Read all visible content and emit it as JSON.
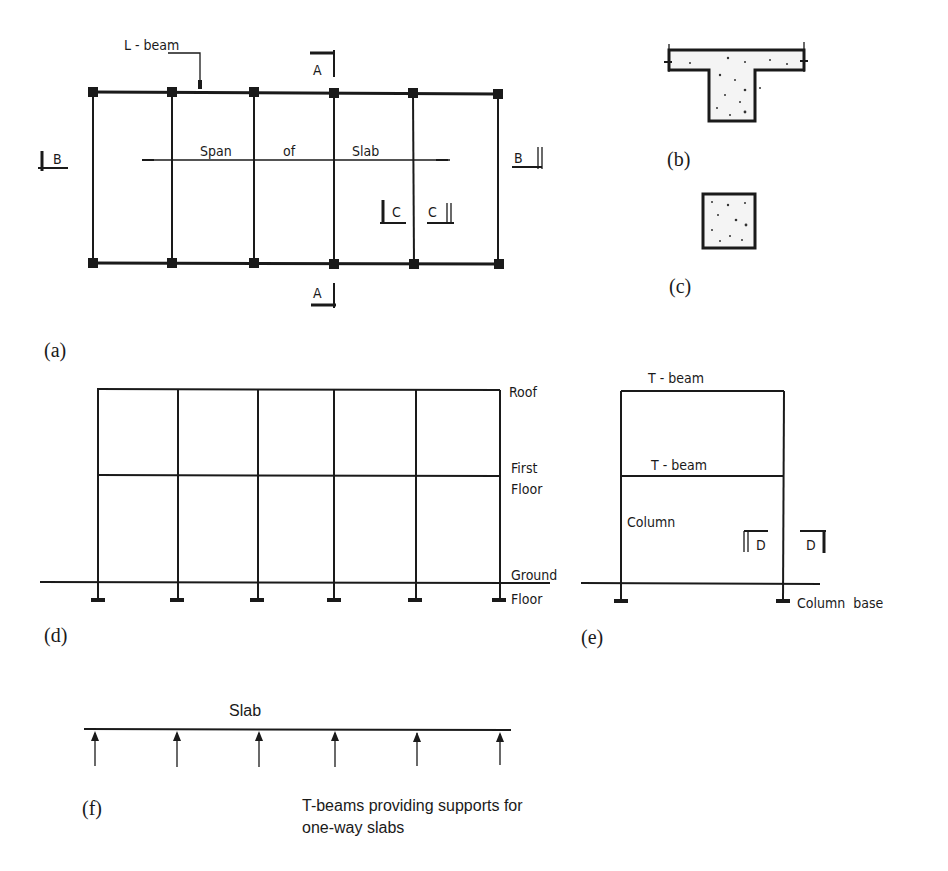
{
  "figure": {
    "panels": {
      "a": {
        "label": "(a)",
        "title": "Floor plan",
        "callouts": {
          "l_beam": "L - beam",
          "span_of_slab": [
            "Span",
            "of",
            "Slab"
          ],
          "section_a_top": "A",
          "section_a_bottom": "A",
          "section_b_left": "B",
          "section_b_right": "B",
          "section_c_left": "C",
          "section_c_right": "C"
        }
      },
      "b": {
        "label": "(b)",
        "title": "T-beam section B-B"
      },
      "c": {
        "label": "(c)",
        "title": "Column section C-C"
      },
      "d": {
        "label": "(d)",
        "title": "Section A-A",
        "levels": {
          "roof": "Roof",
          "first_floor": [
            "First",
            "Floor"
          ],
          "ground_floor": [
            "Ground",
            "Floor"
          ]
        }
      },
      "e": {
        "label": "(e)",
        "title": "Section B-B frame",
        "callouts": {
          "roof_beam": "T - beam",
          "floor_beam": "T - beam",
          "column": "Column",
          "section_d_left": "D",
          "section_d_right": "D",
          "column_base": "Column  base"
        }
      },
      "f": {
        "label": "(f)",
        "title": "Slab support diagram",
        "slab_label": "Slab",
        "caption": [
          "T-beams providing supports for",
          "one-way slabs"
        ]
      }
    },
    "colors": {
      "ink": "#1a1a1a",
      "background": "#ffffff",
      "concrete_fill": "#f4f4f4"
    }
  }
}
